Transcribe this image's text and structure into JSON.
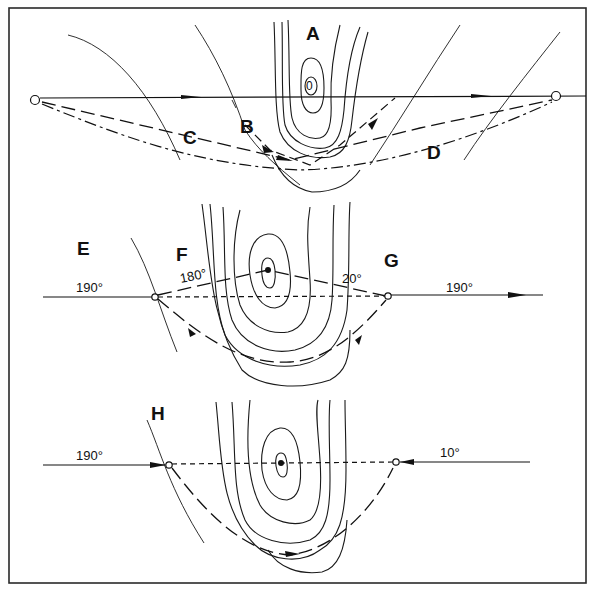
{
  "figure": {
    "panels": [
      {
        "id": "top",
        "labels": {
          "center": "A",
          "route_b": "B",
          "route_c": "C",
          "route_d": "D"
        },
        "contour_center_value": "0"
      },
      {
        "id": "middle",
        "labels": {
          "left": "E",
          "mid": "F",
          "right": "G"
        },
        "headings": {
          "west_in": "190°",
          "leg1": "180°",
          "leg2": "20°",
          "east_out": "190°"
        }
      },
      {
        "id": "bottom",
        "labels": {
          "left": "H"
        },
        "headings": {
          "west_in": "190°",
          "east_in": "10°"
        }
      }
    ],
    "colors": {
      "ink": "#111111",
      "background": "#ffffff",
      "frame": "#2a2a2a"
    }
  }
}
